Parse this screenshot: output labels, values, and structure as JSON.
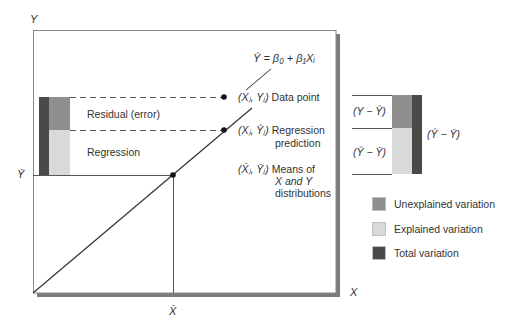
{
  "axes": {
    "y_label": "Y",
    "x_label": "X",
    "y_mean_label": "Ȳ",
    "x_mean_label": "X̄"
  },
  "equation": "Ŷ = β₀ + β₁Xᵢ",
  "points": {
    "data_point": {
      "coord": "(Xⱼ, Yⱼ)",
      "label": "Data point"
    },
    "regression_prediction": {
      "coord": "(Xⱼ, Ŷⱼ)",
      "label_line1": "Regression",
      "label_line2": "prediction"
    },
    "means": {
      "coord": "(X̄ⱼ, Ȳⱼ)",
      "label_line1": "Means of",
      "label_line2": "X and Y",
      "label_line3": "distributions"
    }
  },
  "left_bar": {
    "residual_label": "Residual (error)",
    "regression_label": "Regression"
  },
  "right_bar": {
    "top_label": "(Y − Ŷ)",
    "bottom_label": "(Ŷ − Ȳ)",
    "total_label": "(Ŷ − Ȳ)"
  },
  "legend": [
    {
      "label": "Unexplained variation",
      "color": "#8f8f8f"
    },
    {
      "label": "Explained variation",
      "color": "#d9d9d9"
    },
    {
      "label": "Total variation",
      "color": "#4a4a4a"
    }
  ],
  "colors": {
    "unexplained": "#8f8f8f",
    "explained": "#d9d9d9",
    "total": "#4a4a4a",
    "frame_shadow": "#7a7a7a",
    "line": "#333333"
  }
}
